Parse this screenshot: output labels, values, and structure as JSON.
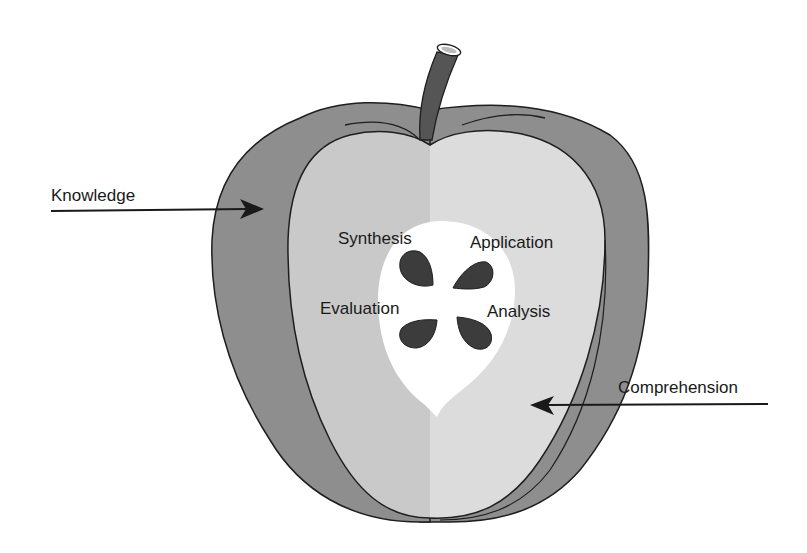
{
  "diagram": {
    "labels": {
      "knowledge": "Knowledge",
      "comprehension": "Comprehension",
      "synthesis": "Synthesis",
      "application": "Application",
      "evaluation": "Evaluation",
      "analysis": "Analysis"
    },
    "regions": [
      {
        "name": "skin",
        "label": "Knowledge",
        "color": "#8e8e8e"
      },
      {
        "name": "flesh",
        "label": "Comprehension",
        "color": "#cbcbcb"
      },
      {
        "name": "core",
        "labels": [
          "Synthesis",
          "Application",
          "Evaluation",
          "Analysis"
        ],
        "color": "#ffffff"
      }
    ],
    "colors": {
      "skin": "#8e8e8e",
      "flesh_left": "#c9c9c9",
      "flesh_right": "#dcdcdc",
      "core": "#ffffff",
      "seed": "#3c3c3c",
      "stem": "#555555",
      "outline": "#1e1e1e"
    }
  }
}
